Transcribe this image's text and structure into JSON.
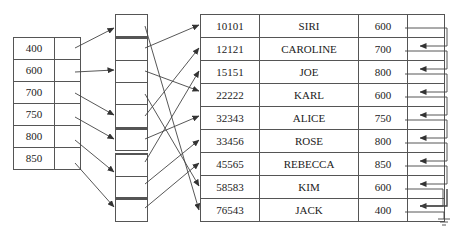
{
  "left_index": {
    "rows": [
      {
        "value": "400"
      },
      {
        "value": "600"
      },
      {
        "value": "700"
      },
      {
        "value": "750"
      },
      {
        "value": "800"
      },
      {
        "value": "850"
      }
    ]
  },
  "buckets": [
    {
      "top": 14,
      "cells": 1,
      "cell_height": 22
    },
    {
      "top": 37,
      "cells": 4,
      "cell_height": 22
    },
    {
      "top": 128,
      "cells": 1,
      "cell_height": 22
    },
    {
      "top": 152,
      "cells": 2,
      "cell_height": 22
    },
    {
      "top": 197,
      "cells": 1,
      "cell_height": 22
    }
  ],
  "records": {
    "columns": [
      "id",
      "name",
      "salary",
      "pointer"
    ],
    "rows": [
      {
        "id": "10101",
        "name": "SIRI",
        "salary": "600"
      },
      {
        "id": "12121",
        "name": "CAROLINE",
        "salary": "700"
      },
      {
        "id": "15151",
        "name": "JOE",
        "salary": "800"
      },
      {
        "id": "22222",
        "name": "KARL",
        "salary": "600"
      },
      {
        "id": "32343",
        "name": "ALICE",
        "salary": "750"
      },
      {
        "id": "33456",
        "name": "ROSE",
        "salary": "800"
      },
      {
        "id": "45565",
        "name": "REBECCA",
        "salary": "850"
      },
      {
        "id": "58583",
        "name": "KIM",
        "salary": "600"
      },
      {
        "id": "76543",
        "name": "JACK",
        "salary": "400"
      }
    ]
  },
  "colors": {
    "line": "#555555",
    "arrow": "#333333"
  }
}
